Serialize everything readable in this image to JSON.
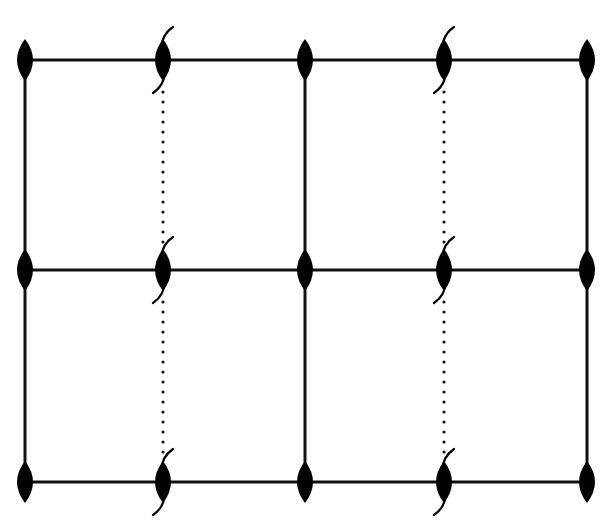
{
  "diagram": {
    "type": "grid-lattice",
    "width": 614,
    "height": 524,
    "colors": {
      "background": "#ffffff",
      "line": "#111111",
      "node": "#000000"
    },
    "columns_x": [
      25,
      163,
      305,
      444,
      587
    ],
    "rows_y": [
      60,
      270,
      482
    ],
    "vertical_edges": [
      {
        "col": 0,
        "style": "solid"
      },
      {
        "col": 1,
        "style": "dotted"
      },
      {
        "col": 2,
        "style": "solid"
      },
      {
        "col": 3,
        "style": "dotted"
      },
      {
        "col": 4,
        "style": "solid"
      }
    ],
    "horizontal_edges": [
      {
        "row": 0,
        "style": "solid"
      },
      {
        "row": 1,
        "style": "solid"
      },
      {
        "row": 2,
        "style": "solid"
      }
    ],
    "node_shape": "vertical-lens",
    "node_size": {
      "rx": 8,
      "ry": 21
    },
    "nodes": [
      {
        "col": 0,
        "row": 0,
        "slash": false
      },
      {
        "col": 1,
        "row": 0,
        "slash": true
      },
      {
        "col": 2,
        "row": 0,
        "slash": false
      },
      {
        "col": 3,
        "row": 0,
        "slash": true
      },
      {
        "col": 4,
        "row": 0,
        "slash": false
      },
      {
        "col": 0,
        "row": 1,
        "slash": false
      },
      {
        "col": 1,
        "row": 1,
        "slash": true
      },
      {
        "col": 2,
        "row": 1,
        "slash": false
      },
      {
        "col": 3,
        "row": 1,
        "slash": true
      },
      {
        "col": 4,
        "row": 1,
        "slash": false
      },
      {
        "col": 0,
        "row": 2,
        "slash": false
      },
      {
        "col": 1,
        "row": 2,
        "slash": true
      },
      {
        "col": 2,
        "row": 2,
        "slash": false
      },
      {
        "col": 3,
        "row": 2,
        "slash": true
      },
      {
        "col": 4,
        "row": 2,
        "slash": false
      }
    ]
  }
}
